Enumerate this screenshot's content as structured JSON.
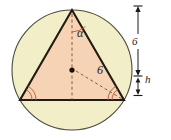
{
  "figure": {
    "type": "geometry-diagram",
    "background_color": "#ffffff",
    "circle": {
      "fill_color": "#f2efc8",
      "stroke_color": "#4a4a3c",
      "center_x": 72,
      "center_y": 70,
      "radius": 60
    },
    "triangle": {
      "fill_color": "#f6d3b4",
      "stroke_color": "#231a14",
      "apex_x": 72,
      "apex_y": 10,
      "left_x": 20,
      "left_y": 100,
      "right_x": 124,
      "right_y": 100
    },
    "center_dot": {
      "x": 72,
      "y": 70,
      "color": "#1a1008"
    },
    "dashed_lines": {
      "color": "#8c5a3c",
      "vertical_from_apex": true,
      "radius_to_right_vertex": true
    },
    "angle_marks": {
      "color": "#b4593c",
      "apex_arcs": 1,
      "left_vertex_arcs": 2,
      "right_vertex_arcs": 2
    },
    "dimension_bar": {
      "x": 138,
      "top_y": 10,
      "mid_y": 75,
      "bottom_y": 100,
      "color": "#1a1a1a"
    }
  },
  "labels": {
    "apex_angle": "α",
    "radius": "6",
    "side_length": "6",
    "height": "h"
  }
}
